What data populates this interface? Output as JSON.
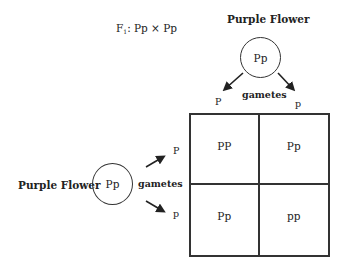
{
  "cross": {
    "generation": "F",
    "generation_sub": "1",
    "label": ": Pp × Pp"
  },
  "parent_top": {
    "title": "Purple Flower",
    "genotype": "Pp",
    "gametes_label": "gametes",
    "gamete_left": "P",
    "gamete_right": "p"
  },
  "parent_left": {
    "title": "Purple Flower",
    "genotype": "Pp",
    "gametes_label": "gametes",
    "gamete_top": "P",
    "gamete_bottom": "p"
  },
  "punnett": {
    "cells": [
      "PP",
      "Pp",
      "Pp",
      "pp"
    ]
  },
  "colors": {
    "line": "#333333",
    "text": "#222222",
    "background": "#ffffff"
  }
}
